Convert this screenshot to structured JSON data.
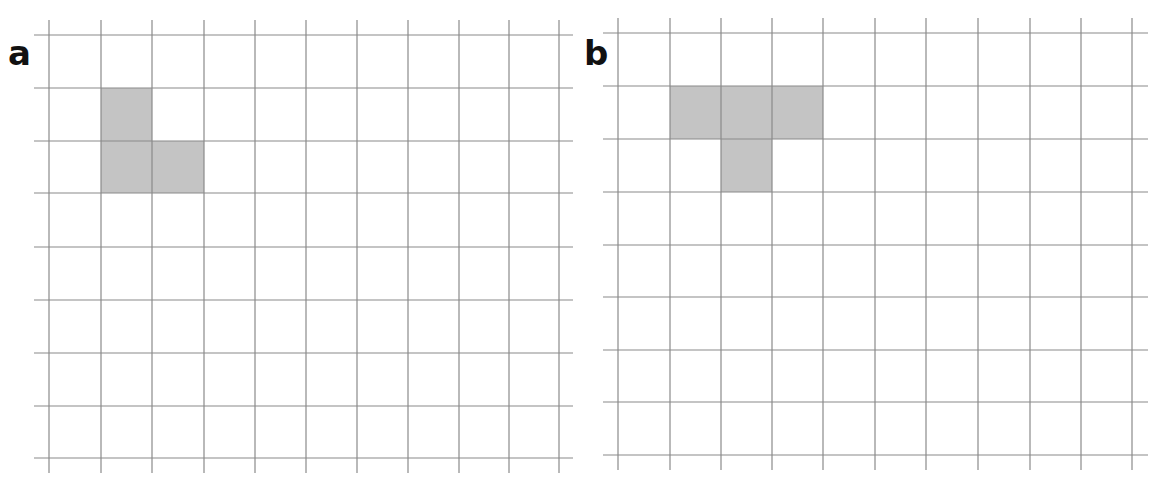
{
  "panels": [
    {
      "label": "a",
      "label_pos": [
        8,
        36
      ],
      "v_lines": [
        49,
        101,
        152,
        204,
        255,
        306,
        357,
        408,
        459,
        509,
        559
      ],
      "h_lines": [
        35,
        88,
        141,
        193,
        247,
        300,
        353,
        406,
        458
      ],
      "h_extent": [
        34,
        573
      ],
      "v_extent": [
        20,
        473
      ],
      "shaded_cells": [
        [
          1,
          1
        ],
        [
          2,
          1
        ],
        [
          2,
          2
        ]
      ]
    },
    {
      "label": "b",
      "label_pos": [
        584,
        36
      ],
      "v_lines": [
        618,
        670,
        721,
        772,
        823,
        875,
        926,
        978,
        1030,
        1081,
        1132
      ],
      "h_lines": [
        33,
        86,
        139,
        192,
        245,
        297,
        350,
        402,
        455
      ],
      "h_extent": [
        603,
        1148
      ],
      "v_extent": [
        18,
        470
      ],
      "shaded_cells": [
        [
          1,
          1
        ],
        [
          1,
          2
        ],
        [
          1,
          3
        ],
        [
          2,
          2
        ]
      ]
    }
  ],
  "colors": {
    "grid_line": "#8a8a8a",
    "shade": "#c4c4c4",
    "label": "#111111"
  }
}
